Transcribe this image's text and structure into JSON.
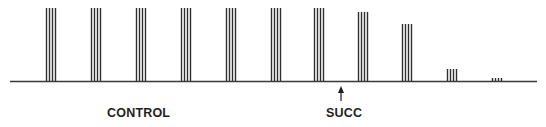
{
  "figure": {
    "type": "spike-train",
    "baseline": {
      "x_start": 10,
      "x_end": 537,
      "y": 81,
      "color": "#3a3a3a"
    },
    "line_color": "#2e2e2e",
    "burst": {
      "lines_per_burst": 4,
      "line_spacing": 3,
      "line_width": 1.4
    },
    "bursts": [
      {
        "x": 46,
        "top": 8
      },
      {
        "x": 91,
        "top": 8
      },
      {
        "x": 136,
        "top": 8
      },
      {
        "x": 181,
        "top": 8
      },
      {
        "x": 226,
        "top": 8
      },
      {
        "x": 271,
        "top": 8
      },
      {
        "x": 314,
        "top": 8
      },
      {
        "x": 358,
        "top": 12
      },
      {
        "x": 402,
        "top": 24
      },
      {
        "x": 447,
        "top": 69
      },
      {
        "x": 492,
        "top": 78
      }
    ],
    "arrow": {
      "x": 341,
      "y_tip": 86,
      "y_tail": 101
    }
  },
  "labels": {
    "control": "CONTROL",
    "succ": "SUCC"
  }
}
